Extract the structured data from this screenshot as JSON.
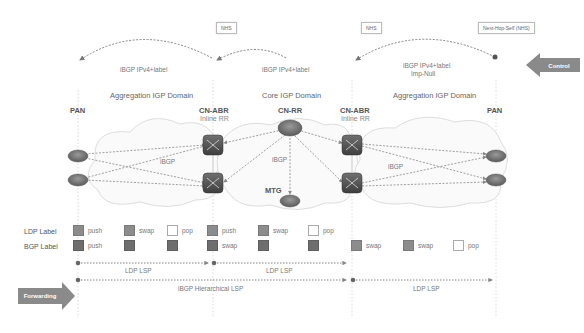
{
  "control": {
    "label": "Control",
    "callouts": [
      "NHS",
      "NHS",
      "Next-Hop-Self (NHS)"
    ],
    "bgp_labels": [
      "iBGP IPv4+label",
      "iBGP IPv4+label",
      "iBGP IPv4+label",
      "Imp-Null"
    ]
  },
  "domains": [
    "Aggregation IGP Domain",
    "Core IGP Domain",
    "Aggregation IGP Domain"
  ],
  "nodes": {
    "pan_left": "PAN",
    "abr_left": "CN-ABR",
    "abr_left_sub": "Inline RR",
    "rr": "CN-RR",
    "abr_right": "CN-ABR",
    "abr_right_sub": "Inline RR",
    "pan_right": "PAN",
    "mtg": "MTG"
  },
  "links": {
    "ibgp_left": "iBGP",
    "ibgp_core": "iBGP",
    "ibgp_right": "iBGP"
  },
  "labels": {
    "ldp_row": "LDP Label",
    "bgp_row": "BGP Label",
    "ldp": [
      {
        "style": "filled",
        "text": "push"
      },
      {
        "style": "filled",
        "text": "swap"
      },
      {
        "style": "empty",
        "text": "pop"
      },
      {
        "style": "filled",
        "text": "push"
      },
      {
        "style": "filled",
        "text": "swap"
      },
      {
        "style": "empty",
        "text": "pop"
      }
    ],
    "bgp": [
      {
        "style": "dark",
        "text": "push"
      },
      {
        "style": "dark",
        "text": ""
      },
      {
        "style": "dark",
        "text": ""
      },
      {
        "style": "dark",
        "text": "swap"
      },
      {
        "style": "dark",
        "text": ""
      },
      {
        "style": "dark",
        "text": ""
      },
      {
        "style": "filled",
        "text": "swap"
      },
      {
        "style": "filled",
        "text": "swap"
      },
      {
        "style": "empty",
        "text": "pop"
      }
    ]
  },
  "forwarding": {
    "label": "Forwarding",
    "lsps": [
      "LDP LSP",
      "LDP LSP",
      "iBGP Hierarchical LSP",
      "LDP LSP"
    ]
  },
  "colors": {
    "line": "#888888",
    "cloud": "#d8d8d8",
    "router": "#6a6a6a",
    "arrow": "#8a8a8a"
  }
}
